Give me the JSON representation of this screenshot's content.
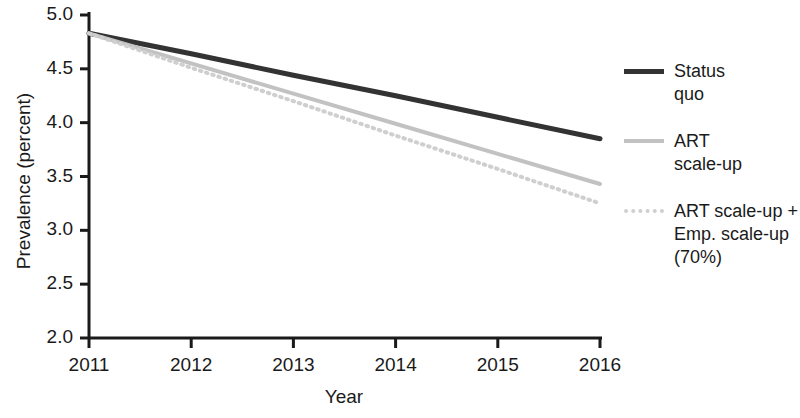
{
  "chart_data": {
    "type": "line",
    "title": "",
    "xlabel": "Year",
    "ylabel": "Prevalence (percent)",
    "x": [
      2011,
      2012,
      2013,
      2014,
      2015,
      2016
    ],
    "xtick_labels": [
      "2011",
      "2012",
      "2013",
      "2014",
      "2015",
      "2016"
    ],
    "ytick_labels": [
      "2.0",
      "2.5",
      "3.0",
      "3.5",
      "4.0",
      "4.5",
      "5.0"
    ],
    "yticks": [
      2.0,
      2.5,
      3.0,
      3.5,
      4.0,
      4.5,
      5.0
    ],
    "xlim": [
      2011,
      2016
    ],
    "ylim": [
      2.0,
      5.0
    ],
    "grid": false,
    "legend_position": "right",
    "series": [
      {
        "name": "Status quo",
        "legend_label_line1": "Status",
        "legend_label_line2": "quo",
        "color": "#333333",
        "style": "solid",
        "width": 5,
        "values": [
          4.83,
          4.64,
          4.44,
          4.25,
          4.05,
          3.85
        ]
      },
      {
        "name": "ART scale-up",
        "legend_label_line1": "ART",
        "legend_label_line2": "scale-up",
        "color": "#c2c2c2",
        "style": "solid",
        "width": 4,
        "values": [
          4.83,
          4.55,
          4.27,
          3.99,
          3.71,
          3.43
        ]
      },
      {
        "name": "ART scale-up + Emp. scale-up (70%)",
        "legend_label_line1": "ART scale-up +",
        "legend_label_line2": "Emp. scale-up",
        "legend_label_line3": "(70%)",
        "color": "#cfcfcf",
        "style": "dotted",
        "width": 4,
        "values": [
          4.83,
          4.51,
          4.2,
          3.88,
          3.57,
          3.25
        ]
      }
    ]
  },
  "axes": {
    "axis_color": "#1a1a1a"
  }
}
